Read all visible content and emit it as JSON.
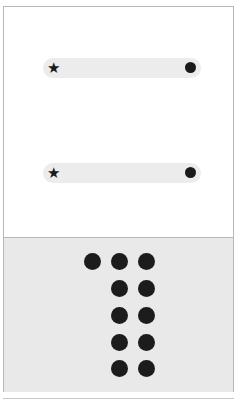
{
  "sliders": [
    {
      "start_icon": "★",
      "end_icon": "●"
    },
    {
      "start_icon": "★",
      "end_icon": "●"
    }
  ],
  "grid": {
    "columns": [
      {
        "count": 1
      },
      {
        "count": 5
      },
      {
        "count": 5
      }
    ]
  },
  "colors": {
    "background": "#ffffff",
    "panel": "#e9e9e9",
    "track": "#ececec",
    "peg": "#1c1c1c",
    "border": "#b8b8b8"
  }
}
